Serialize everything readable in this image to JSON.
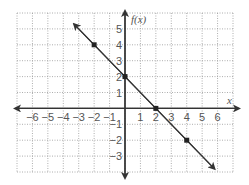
{
  "chart_data": {
    "type": "line",
    "title": "",
    "xlabel": "x",
    "ylabel": "f(x)",
    "xlim": [
      -7,
      7
    ],
    "ylim": [
      -4,
      6
    ],
    "grid": true,
    "grid_style": "dotted",
    "x_ticks": [
      -6,
      -5,
      -4,
      -3,
      -2,
      -1,
      1,
      2,
      3,
      4,
      5,
      6
    ],
    "y_ticks": [
      5,
      4,
      3,
      2,
      1,
      -1,
      -2,
      -3
    ],
    "series": [
      {
        "name": "f(x) = -x + 2",
        "line": {
          "slope": -1,
          "intercept": 2,
          "from": [
            -3.3,
            5.3
          ],
          "to": [
            5.8,
            -3.8
          ],
          "arrows": "both"
        },
        "points": [
          [
            -2,
            4
          ],
          [
            0,
            2
          ],
          [
            2,
            0
          ],
          [
            4,
            -2
          ]
        ]
      }
    ],
    "colors": {
      "line": "#333333",
      "axis": "#333333",
      "grid": "#999999",
      "text": "#555555"
    }
  }
}
